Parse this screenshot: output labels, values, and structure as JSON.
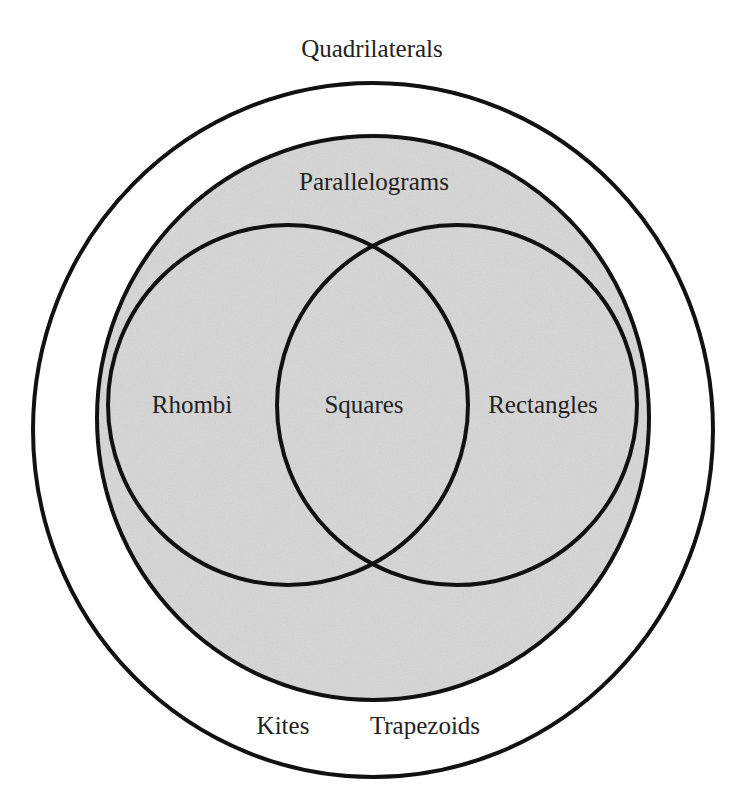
{
  "diagram": {
    "type": "venn",
    "title": "Quadrilaterals",
    "colors": {
      "background": "#ffffff",
      "fill": "#d6d6d6",
      "stroke": "#111111",
      "text": "#222222"
    },
    "sets": {
      "outer": {
        "label": "Quadrilaterals"
      },
      "parallelograms": {
        "label": "Parallelograms"
      },
      "rhombi": {
        "label": "Rhombi"
      },
      "rectangles": {
        "label": "Rectangles"
      },
      "intersection": {
        "label": "Squares"
      }
    },
    "outside_parallelograms": [
      {
        "label": "Kites"
      },
      {
        "label": "Trapezoids"
      }
    ]
  }
}
